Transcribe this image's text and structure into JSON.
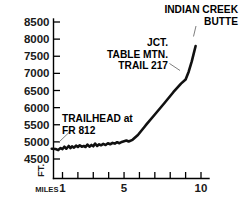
{
  "chart_data": {
    "type": "line",
    "title": "",
    "xlabel": "MILES",
    "ylabel": "FT.",
    "xlim": [
      0,
      10.6
    ],
    "ylim": [
      4250,
      8500
    ],
    "grid": false,
    "legend": null,
    "x_ticks": [
      1,
      2,
      3,
      4,
      5,
      6,
      7,
      8,
      9,
      10
    ],
    "x_tick_labels": [
      "1",
      "",
      "",
      "",
      "5",
      "",
      "",
      "",
      "",
      "10"
    ],
    "y_ticks": [
      4500,
      5000,
      5500,
      6000,
      6500,
      7000,
      7500,
      8000,
      8500
    ],
    "y_tick_labels": [
      "4500",
      "5000",
      "5500",
      "6000",
      "6500",
      "7000",
      "7500",
      "8000",
      "8500"
    ],
    "series": [
      {
        "name": "Indian Creek Butte trail elevation profile",
        "x": [
          0.3,
          0.55,
          0.72,
          0.88,
          1.0,
          1.12,
          1.25,
          1.4,
          1.52,
          1.62,
          1.75,
          1.88,
          2.0,
          2.12,
          2.25,
          2.38,
          2.5,
          2.62,
          2.75,
          2.88,
          3.0,
          3.12,
          3.25,
          3.38,
          3.5,
          3.65,
          3.8,
          3.95,
          4.1,
          4.25,
          4.4,
          4.55,
          4.7,
          4.85,
          5.0,
          5.15,
          5.3,
          5.55,
          5.9,
          6.4,
          7.0,
          7.6,
          8.2,
          8.7,
          9.0,
          9.2,
          9.4,
          9.55,
          9.65
        ],
        "y": [
          4800,
          4790,
          4760,
          4820,
          4790,
          4860,
          4800,
          4880,
          4820,
          4870,
          4830,
          4890,
          4850,
          4900,
          4860,
          4880,
          4850,
          4920,
          4860,
          4910,
          4870,
          4950,
          4880,
          4930,
          4900,
          4940,
          4910,
          4960,
          4930,
          4970,
          4950,
          4990,
          4960,
          5000,
          5020,
          5040,
          5010,
          5060,
          5200,
          5480,
          5800,
          6120,
          6450,
          6700,
          6820,
          7050,
          7350,
          7620,
          7800
        ]
      }
    ],
    "annotations": [
      {
        "id": "summit",
        "lines": [
          "INDIAN CREEK",
          "BUTTE"
        ],
        "points_to_x": 9.65,
        "points_to_y": 7800
      },
      {
        "id": "junction",
        "lines": [
          "JCT.",
          "TABLE MTN.",
          "TRAIL 217"
        ],
        "points_to_x": 9.0,
        "points_to_y": 6820
      },
      {
        "id": "trailhead",
        "lines": [
          "TRAILHEAD at",
          "FR 812"
        ],
        "points_to_x": 0.4,
        "points_to_y": 4800
      }
    ]
  }
}
